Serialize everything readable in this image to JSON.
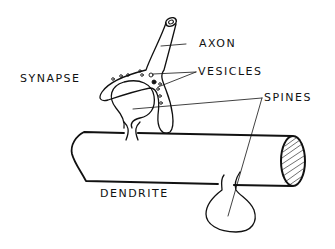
{
  "diagram": {
    "labels": {
      "axon": "AXON",
      "synapse": "SYNAPSE",
      "vesicles": "VESICLES",
      "spines": "SPINES",
      "dendrite": "DENDRITE"
    },
    "colors": {
      "ink": "#111111",
      "background": "#ffffff"
    }
  }
}
